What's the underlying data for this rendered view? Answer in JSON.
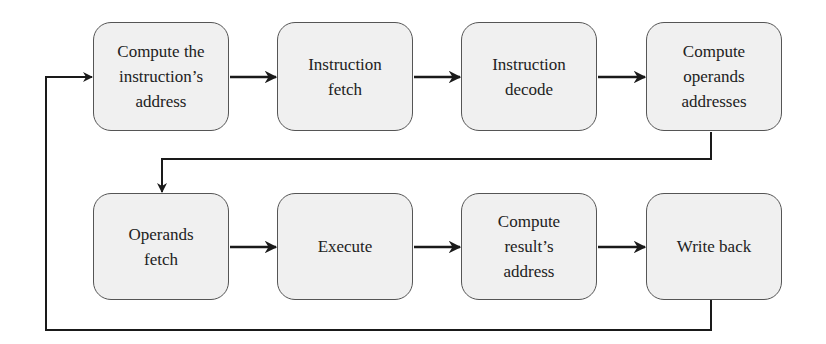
{
  "diagram": {
    "type": "flowchart",
    "rows": [
      {
        "steps": [
          {
            "id": "compute-instruction-address",
            "label": "Compute the\ninstruction’s\naddress"
          },
          {
            "id": "instruction-fetch",
            "label": "Instruction\nfetch"
          },
          {
            "id": "instruction-decode",
            "label": "Instruction\ndecode"
          },
          {
            "id": "compute-operands-addresses",
            "label": "Compute\noperands\naddresses"
          }
        ]
      },
      {
        "steps": [
          {
            "id": "operands-fetch",
            "label": "Operands\nfetch"
          },
          {
            "id": "execute",
            "label": "Execute"
          },
          {
            "id": "compute-result-address",
            "label": "Compute\nresult’s\naddress"
          },
          {
            "id": "write-back",
            "label": "Write back"
          }
        ]
      }
    ],
    "edges": [
      [
        "compute-instruction-address",
        "instruction-fetch"
      ],
      [
        "instruction-fetch",
        "instruction-decode"
      ],
      [
        "instruction-decode",
        "compute-operands-addresses"
      ],
      [
        "compute-operands-addresses",
        "operands-fetch"
      ],
      [
        "operands-fetch",
        "execute"
      ],
      [
        "execute",
        "compute-result-address"
      ],
      [
        "compute-result-address",
        "write-back"
      ],
      [
        "write-back",
        "compute-instruction-address"
      ]
    ],
    "colors": {
      "box_fill": "#f0f0f0",
      "box_border": "#555555",
      "line": "#1a1a1a"
    }
  }
}
